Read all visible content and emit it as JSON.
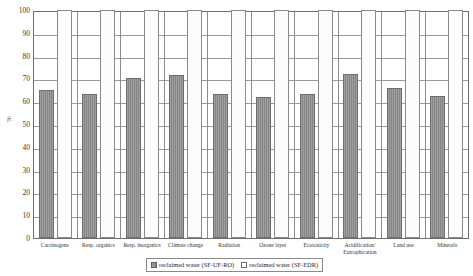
{
  "chart_data": {
    "type": "bar",
    "title": "",
    "subtitle": "",
    "xlabel": "",
    "ylabel": "%",
    "ylim": [
      0,
      100
    ],
    "ytick_step": 10,
    "yticks": [
      100,
      90,
      80,
      70,
      60,
      50,
      40,
      30,
      20,
      10,
      0
    ],
    "grid": true,
    "legend_position": "bottom-center",
    "categories": [
      "Carcinogens",
      "Resp. organics",
      "Resp. inorganics",
      "Climate change",
      "Radiation",
      "Ozone layer",
      "Ecotoxicity",
      "Acidification/ Eutrophication",
      "Land use",
      "Minerals"
    ],
    "series": [
      {
        "name": "reclaimed water (SF-UF-RO)",
        "fill": "gray-hatched",
        "color": "#8d8d8d",
        "values": [
          65,
          63,
          70,
          71.5,
          63,
          62,
          63,
          72,
          66,
          62.5
        ]
      },
      {
        "name": "reclaimed water (SF-EDR)",
        "fill": "white",
        "color": "#ffffff",
        "values": [
          100,
          100,
          100,
          100,
          100,
          100,
          100,
          100,
          100,
          100
        ]
      }
    ]
  },
  "axes": {
    "y_title": "%"
  },
  "legend": {
    "entries": [
      {
        "label": "reclaimed water (SF-UF-RO)"
      },
      {
        "label": "reclaimed water (SF-EDR)"
      }
    ]
  },
  "colors": {
    "series_a": "#8d8d8d",
    "series_b": "#ffffff",
    "axis": "#6e6e6e",
    "grid": "#9a9a9a"
  }
}
